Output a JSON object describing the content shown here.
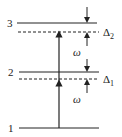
{
  "diagram": {
    "type": "energy-level-diagram",
    "levels": [
      {
        "label": "1",
        "y": 128
      },
      {
        "label": "2",
        "y": 72
      },
      {
        "label": "3",
        "y": 23
      }
    ],
    "detuning_labels": {
      "delta1": {
        "symbol": "Δ",
        "subscript": "1"
      },
      "delta2": {
        "symbol": "Δ",
        "subscript": "2"
      }
    },
    "photon_labels": {
      "lower": "ω",
      "upper": "ω"
    },
    "colors": {
      "line": "#222222",
      "background": "#ffffff"
    }
  }
}
